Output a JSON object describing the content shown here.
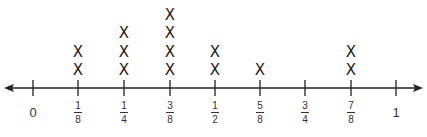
{
  "chart_data": {
    "type": "line-plot",
    "title": "",
    "xlabel": "",
    "ylabel": "",
    "marker": "X",
    "xlim": [
      0,
      1
    ],
    "tick_labels": [
      "0",
      "1/8",
      "1/4",
      "3/8",
      "1/2",
      "5/8",
      "3/4",
      "7/8",
      "1"
    ],
    "categories": [
      "1/8",
      "1/4",
      "3/8",
      "1/2",
      "5/8",
      "3/4",
      "7/8"
    ],
    "values": [
      2,
      3,
      4,
      2,
      1,
      0,
      2
    ],
    "axis_arrows": "both",
    "grid": false
  },
  "ticks": [
    {
      "label": "0",
      "whole": true,
      "x": 33
    },
    {
      "num": "1",
      "den": "8",
      "x": 78
    },
    {
      "num": "1",
      "den": "4",
      "x": 124
    },
    {
      "num": "3",
      "den": "8",
      "x": 170
    },
    {
      "num": "1",
      "den": "2",
      "x": 215
    },
    {
      "num": "5",
      "den": "8",
      "x": 260
    },
    {
      "num": "3",
      "den": "4",
      "x": 305
    },
    {
      "num": "7",
      "den": "8",
      "x": 351
    },
    {
      "label": "1",
      "whole": true,
      "x": 396
    }
  ],
  "marks": [
    {
      "x": 78,
      "count": 2
    },
    {
      "x": 124,
      "count": 3
    },
    {
      "x": 170,
      "count": 4
    },
    {
      "x": 215,
      "count": 2
    },
    {
      "x": 260,
      "count": 1
    },
    {
      "x": 305,
      "count": 0
    },
    {
      "x": 351,
      "count": 2
    }
  ]
}
